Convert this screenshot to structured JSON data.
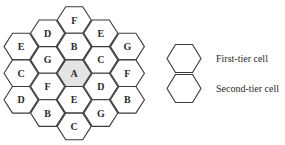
{
  "diagram": {
    "cells": [
      {
        "label": "E",
        "col": 0,
        "row": 1
      },
      {
        "label": "C",
        "col": 0,
        "row": 2
      },
      {
        "label": "D",
        "col": 0,
        "row": 3
      },
      {
        "label": "D",
        "col": 1,
        "row": 0.5
      },
      {
        "label": "G",
        "col": 1,
        "row": 1.5
      },
      {
        "label": "F",
        "col": 1,
        "row": 2.5
      },
      {
        "label": "B",
        "col": 1,
        "row": 3.5
      },
      {
        "label": "F",
        "col": 2,
        "row": 0
      },
      {
        "label": "B",
        "col": 2,
        "row": 1
      },
      {
        "label": "A",
        "col": 2,
        "row": 2,
        "highlight": true
      },
      {
        "label": "E",
        "col": 2,
        "row": 3
      },
      {
        "label": "C",
        "col": 2,
        "row": 4
      },
      {
        "label": "E",
        "col": 3,
        "row": 0.5
      },
      {
        "label": "C",
        "col": 3,
        "row": 1.5
      },
      {
        "label": "D",
        "col": 3,
        "row": 2.5
      },
      {
        "label": "G",
        "col": 3,
        "row": 3.5
      },
      {
        "label": "G",
        "col": 4,
        "row": 1
      },
      {
        "label": "F",
        "col": 4,
        "row": 2
      },
      {
        "label": "B",
        "col": 4,
        "row": 3
      }
    ],
    "legend": [
      {
        "label": "First-tier cell"
      },
      {
        "label": "Second-tier cell"
      }
    ],
    "colors": {
      "stroke": "#3a3a3a",
      "center_fill": "#e4e4e4",
      "cell_fill": "#ffffff"
    }
  }
}
